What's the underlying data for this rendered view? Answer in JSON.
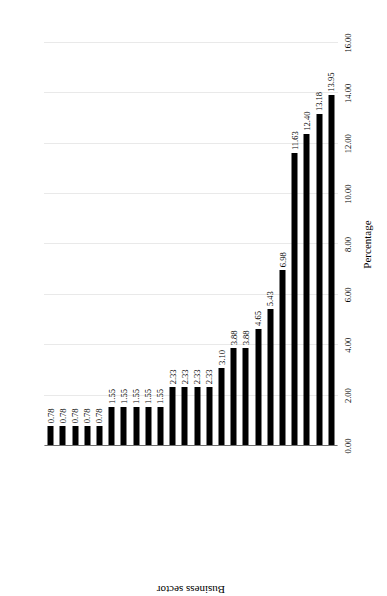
{
  "chart_data": {
    "type": "bar",
    "orientation": "vertical-rotated",
    "title": "",
    "xlabel": "Business sector",
    "ylabel": "Percentage",
    "ylim": [
      0.0,
      16.0
    ],
    "ytick_labels": [
      "0.00",
      "2.00",
      "4.00",
      "6.00",
      "8.00",
      "10.00",
      "12.00",
      "14.00",
      "16.00"
    ],
    "ytick_values": [
      0,
      2,
      4,
      6,
      8,
      10,
      12,
      14,
      16
    ],
    "grid": true,
    "legend": "none",
    "bar_color": "#000000",
    "categories": [
      "Renewable energy",
      "Psychologist/counselling",
      "Oil and gas",
      "NGO",
      "Communication and PR",
      "Transportation and logistics",
      "Medical services",
      "Legal services",
      "Insurance",
      "Business services/printing",
      "Travel and tourism",
      "Finance and investment",
      "Business consultancy services",
      "Art and entertainment",
      "Interior decorating",
      "Real estate",
      "Hotel and accommodation",
      "Computer related services/ICT",
      "Construction and maintenance",
      "Manufacturing",
      "Health and beauty",
      "Wholesale and retail",
      "Education and training",
      "Restaurant and catering"
    ],
    "values": [
      0.78,
      0.78,
      0.78,
      0.78,
      0.78,
      1.55,
      1.55,
      1.55,
      1.55,
      1.55,
      2.33,
      2.33,
      2.33,
      2.33,
      3.1,
      3.88,
      3.88,
      4.65,
      5.43,
      6.98,
      11.63,
      12.4,
      13.18,
      13.95
    ],
    "value_labels": [
      "0.78",
      "0.78",
      "0.78",
      "0.78",
      "0.78",
      "1.55",
      "1.55",
      "1.55",
      "1.55",
      "1.55",
      "2.33",
      "2.33",
      "2.33",
      "2.33",
      "3.10",
      "3.88",
      "3.88",
      "4.65",
      "5.43",
      "6.98",
      "11.63",
      "12.40",
      "13.18",
      "13.95"
    ]
  }
}
